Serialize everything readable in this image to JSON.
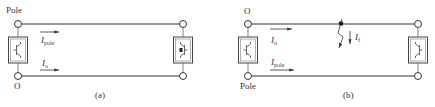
{
  "panels": [
    {
      "id": "a",
      "caption": "(a)",
      "top_terminal_label": "Pole",
      "bottom_terminal_label": "O",
      "currents": [
        {
          "symbol": "I",
          "subscript": "pole",
          "position": "upper",
          "direction": "right"
        },
        {
          "symbol": "I",
          "subscript": "o",
          "position": "lower",
          "direction": "right"
        }
      ],
      "converters": [
        "left-converter",
        "right-converter"
      ],
      "fault": null
    },
    {
      "id": "b",
      "caption": "(b)",
      "top_terminal_label": "O",
      "bottom_terminal_label": "Pole",
      "currents": [
        {
          "symbol": "I",
          "subscript": "o",
          "position": "upper",
          "direction": "right"
        },
        {
          "symbol": "I",
          "subscript": "pole",
          "position": "lower",
          "direction": "right"
        }
      ],
      "converters": [
        "left-converter",
        "right-converter"
      ],
      "fault": {
        "symbol": "I",
        "subscript": "f",
        "location": "top-line-midpoint",
        "direction": "down"
      }
    }
  ],
  "colors": {
    "line": "#333333",
    "background": "#ffffff"
  }
}
